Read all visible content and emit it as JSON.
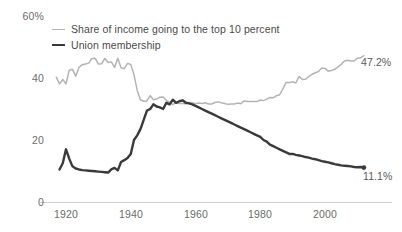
{
  "axes": {
    "y_ticks": [
      {
        "label": "60%",
        "value": 60
      },
      {
        "label": "40",
        "value": 40
      },
      {
        "label": "20",
        "value": 20
      },
      {
        "label": "0",
        "value": 0
      }
    ],
    "x_ticks": [
      {
        "label": "1920",
        "value": 1920
      },
      {
        "label": "1940",
        "value": 1940
      },
      {
        "label": "1960",
        "value": 1960
      },
      {
        "label": "1980",
        "value": 1980
      },
      {
        "label": "2000",
        "value": 2000
      }
    ]
  },
  "legend": {
    "items": [
      {
        "label": "Share of income going to the top 10 percent",
        "color": "#b4b4b4"
      },
      {
        "label": "Union membership",
        "color": "#3a3a3a"
      }
    ]
  },
  "end_labels": {
    "income": "47.2%",
    "union": "11.1%"
  },
  "colors": {
    "income_line": "#b4b4b4",
    "union_line": "#3a3a3a",
    "axis": "#cfcfcf",
    "tick_text": "#6b6b6b"
  },
  "chart_data": {
    "type": "line",
    "title": "",
    "subtitle": "",
    "xlabel": "",
    "ylabel": "",
    "xlim": [
      1917,
      2015
    ],
    "ylim": [
      0,
      60
    ],
    "grid": false,
    "legend_position": "top-left",
    "y_unit": "percent",
    "annotations": [
      {
        "series": "Share of income going to the top 10 percent",
        "x": 2012,
        "y": 47.2,
        "text": "47.2%"
      },
      {
        "series": "Union membership",
        "x": 2012,
        "y": 11.1,
        "text": "11.1%"
      }
    ],
    "series": [
      {
        "name": "Share of income going to the top 10 percent",
        "color": "#b4b4b4",
        "x": [
          1917,
          1918,
          1919,
          1920,
          1921,
          1922,
          1923,
          1924,
          1925,
          1926,
          1927,
          1928,
          1929,
          1930,
          1931,
          1932,
          1933,
          1934,
          1935,
          1936,
          1937,
          1938,
          1939,
          1940,
          1941,
          1942,
          1943,
          1944,
          1945,
          1946,
          1947,
          1948,
          1949,
          1950,
          1951,
          1952,
          1953,
          1954,
          1955,
          1956,
          1957,
          1958,
          1959,
          1960,
          1961,
          1962,
          1963,
          1964,
          1965,
          1966,
          1967,
          1968,
          1969,
          1970,
          1971,
          1972,
          1973,
          1974,
          1975,
          1976,
          1977,
          1978,
          1979,
          1980,
          1981,
          1982,
          1983,
          1984,
          1985,
          1986,
          1987,
          1988,
          1989,
          1990,
          1991,
          1992,
          1993,
          1994,
          1995,
          1996,
          1997,
          1998,
          1999,
          2000,
          2001,
          2002,
          2003,
          2004,
          2005,
          2006,
          2007,
          2008,
          2009,
          2010,
          2011,
          2012
        ],
        "values": [
          40.3,
          38.1,
          39.5,
          38.1,
          42.5,
          42.8,
          40.6,
          43.4,
          44.3,
          44.5,
          44.8,
          46.3,
          46.4,
          44.5,
          44.6,
          46.3,
          45.0,
          45.2,
          43.4,
          46.4,
          43.3,
          43.0,
          44.7,
          44.4,
          41.0,
          36.0,
          33.0,
          32.5,
          32.6,
          34.3,
          33.0,
          33.2,
          33.8,
          33.9,
          32.8,
          32.1,
          31.4,
          32.1,
          31.8,
          31.8,
          31.7,
          32.1,
          32.0,
          31.7,
          31.9,
          31.8,
          32.0,
          31.6,
          31.6,
          32.1,
          32.3,
          32.0,
          31.8,
          31.5,
          31.6,
          31.6,
          31.9,
          31.7,
          32.6,
          32.4,
          32.4,
          32.4,
          32.4,
          32.9,
          32.7,
          33.2,
          33.7,
          33.6,
          34.3,
          34.6,
          36.5,
          38.6,
          38.5,
          38.8,
          38.4,
          40.5,
          39.5,
          39.6,
          40.5,
          41.2,
          41.7,
          42.1,
          43.2,
          43.1,
          42.2,
          42.4,
          42.8,
          43.6,
          44.4,
          45.5,
          45.7,
          45.5,
          45.5,
          46.4,
          46.5,
          47.2
        ]
      },
      {
        "name": "Union membership",
        "color": "#3a3a3a",
        "x": [
          1918,
          1919,
          1920,
          1921,
          1922,
          1923,
          1924,
          1925,
          1926,
          1927,
          1928,
          1929,
          1930,
          1931,
          1932,
          1933,
          1934,
          1935,
          1936,
          1937,
          1938,
          1939,
          1940,
          1941,
          1942,
          1943,
          1944,
          1945,
          1946,
          1947,
          1948,
          1949,
          1950,
          1951,
          1952,
          1953,
          1954,
          1955,
          1956,
          1957,
          1958,
          1959,
          1960,
          1961,
          1962,
          1963,
          1964,
          1965,
          1966,
          1967,
          1968,
          1969,
          1970,
          1971,
          1972,
          1973,
          1974,
          1975,
          1976,
          1977,
          1978,
          1979,
          1980,
          1981,
          1982,
          1983,
          1984,
          1985,
          1986,
          1987,
          1988,
          1989,
          1990,
          1991,
          1992,
          1993,
          1994,
          1995,
          1996,
          1997,
          1998,
          1999,
          2000,
          2001,
          2002,
          2003,
          2004,
          2005,
          2006,
          2007,
          2008,
          2009,
          2010,
          2011,
          2012
        ],
        "values": [
          10.5,
          12.5,
          17.0,
          14.0,
          11.5,
          10.8,
          10.5,
          10.3,
          10.2,
          10.1,
          10.0,
          9.9,
          9.8,
          9.7,
          9.6,
          9.5,
          10.5,
          11.0,
          10.2,
          12.9,
          13.5,
          14.2,
          15.5,
          20.0,
          21.5,
          23.5,
          26.5,
          29.5,
          30.0,
          31.5,
          30.8,
          30.5,
          30.0,
          32.0,
          31.5,
          33.0,
          32.0,
          32.5,
          32.8,
          32.0,
          31.8,
          31.5,
          31.0,
          30.5,
          30.0,
          29.5,
          29.0,
          28.5,
          28.0,
          27.5,
          27.0,
          26.5,
          26.0,
          25.5,
          25.0,
          24.5,
          24.0,
          23.5,
          23.0,
          22.5,
          22.0,
          21.5,
          21.0,
          20.0,
          19.5,
          18.5,
          18.0,
          17.5,
          17.0,
          16.5,
          16.0,
          15.5,
          15.5,
          15.2,
          15.0,
          14.8,
          14.5,
          14.3,
          14.0,
          13.8,
          13.5,
          13.2,
          13.0,
          12.8,
          12.5,
          12.2,
          12.0,
          11.8,
          11.7,
          11.6,
          11.5,
          11.3,
          11.2,
          11.3,
          11.1
        ]
      }
    ]
  }
}
